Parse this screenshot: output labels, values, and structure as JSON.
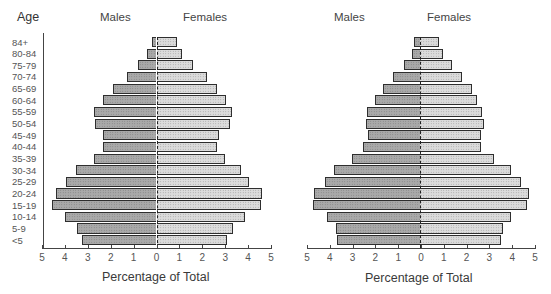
{
  "headers": {
    "age": "Age",
    "left_males": "Males",
    "left_females": "Females",
    "right_males": "Males",
    "right_females": "Females"
  },
  "x_ticks": [
    "5",
    "4",
    "3",
    "2",
    "1",
    "0",
    "1",
    "2",
    "3",
    "4",
    "5"
  ],
  "xlabel": "Percentage of Total",
  "colors": {
    "males": "#a9a9a9",
    "females": "#dcdcdc",
    "border": "#2e2e2e"
  },
  "chart_data": [
    {
      "type": "bar",
      "orientation": "horizontal-population-pyramid",
      "title": "",
      "xlabel": "Percentage of Total",
      "ylabel": "Age",
      "xlim": [
        -5,
        5
      ],
      "grid": false,
      "legend": [
        "Males",
        "Females"
      ],
      "categories": [
        "84+",
        "80-84",
        "75-79",
        "70-74",
        "65-69",
        "60-64",
        "55-59",
        "50-54",
        "45-49",
        "40-44",
        "35-39",
        "30-34",
        "25-29",
        "20-24",
        "15-19",
        "10-14",
        "5-9",
        "<5"
      ],
      "series": [
        {
          "name": "Males",
          "values": [
            0.2,
            0.4,
            0.8,
            1.3,
            1.9,
            2.35,
            2.75,
            2.7,
            2.35,
            2.35,
            2.75,
            3.5,
            3.95,
            4.4,
            4.55,
            4.0,
            3.45,
            3.25
          ]
        },
        {
          "name": "Females",
          "values": [
            0.9,
            1.1,
            1.6,
            2.2,
            2.65,
            3.05,
            3.3,
            3.2,
            2.75,
            2.65,
            3.0,
            3.7,
            4.05,
            4.6,
            4.55,
            3.85,
            3.35,
            3.1
          ]
        }
      ]
    },
    {
      "type": "bar",
      "orientation": "horizontal-population-pyramid",
      "title": "",
      "xlabel": "Percentage of Total",
      "ylabel": "Age",
      "xlim": [
        -5,
        5
      ],
      "grid": false,
      "legend": [
        "Males",
        "Females"
      ],
      "categories": [
        "84+",
        "80-84",
        "75-79",
        "70-74",
        "65-69",
        "60-64",
        "55-59",
        "50-54",
        "45-49",
        "40-44",
        "35-39",
        "30-34",
        "25-29",
        "20-24",
        "15-19",
        "10-14",
        "5-9",
        "<5"
      ],
      "series": [
        {
          "name": "Males",
          "values": [
            0.25,
            0.35,
            0.7,
            1.2,
            1.65,
            2.0,
            2.35,
            2.4,
            2.3,
            2.5,
            3.0,
            3.8,
            4.2,
            4.65,
            4.7,
            4.1,
            3.7,
            3.65
          ]
        },
        {
          "name": "Females",
          "values": [
            0.85,
            1.0,
            1.4,
            1.85,
            2.3,
            2.5,
            2.75,
            2.8,
            2.7,
            2.7,
            3.25,
            4.0,
            4.45,
            4.8,
            4.7,
            4.0,
            3.65,
            3.55
          ]
        }
      ]
    }
  ]
}
